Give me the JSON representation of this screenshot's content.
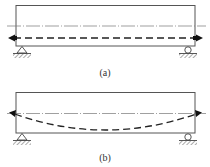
{
  "figure": {
    "panels": [
      {
        "id": "a",
        "label": "(a)",
        "tendon_profile": "straight",
        "supports": {
          "left": "pin",
          "right": "roller"
        }
      },
      {
        "id": "b",
        "label": "(b)",
        "tendon_profile": "parabolic",
        "supports": {
          "left": "pin",
          "right": "roller"
        }
      }
    ],
    "colors": {
      "beam_outline": "#555555",
      "centroid_line": "#666666",
      "tendon": "#222222",
      "label": "#333333"
    }
  }
}
